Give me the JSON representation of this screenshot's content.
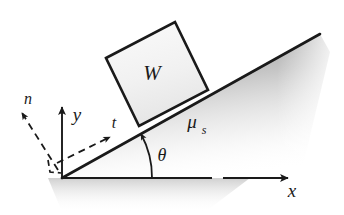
{
  "figure": {
    "background_color": "#ffffff",
    "ink_color": "#1a1a1a",
    "block_fill": "#f0f0f0",
    "shade_color": "#9a9a9a"
  },
  "labels": {
    "weight": "W",
    "friction_coefficient": "μ",
    "friction_subscript": "s",
    "angle": "θ",
    "axis_x": "x",
    "axis_y": "y",
    "vector_normal": "n",
    "vector_tangent": "t"
  },
  "geometry": {
    "origin": {
      "x": 62,
      "y": 178
    },
    "incline_tip": {
      "x": 320,
      "y": 34
    },
    "incline_angle_deg": 29,
    "x_axis_end": {
      "x": 288,
      "y": 178
    },
    "y_axis_end": {
      "x": 62,
      "y": 107
    },
    "block": {
      "top_left": {
        "x": 106,
        "y": 58
      },
      "top_right": {
        "x": 175,
        "y": 22
      },
      "bottom_right": {
        "x": 208,
        "y": 90
      },
      "bottom_left": {
        "x": 139,
        "y": 126
      }
    },
    "normal_vector": {
      "from": {
        "x": 58,
        "y": 170
      },
      "to": {
        "x": 21,
        "y": 112
      }
    },
    "tangent_vector": {
      "from": {
        "x": 61,
        "y": 161
      },
      "to": {
        "x": 110,
        "y": 137
      }
    },
    "theta_arc": {
      "start": {
        "x": 152,
        "y": 178
      },
      "end": {
        "x": 141,
        "y": 133
      }
    }
  },
  "label_positions": {
    "weight": {
      "x": 152,
      "y": 80
    },
    "mu": {
      "x": 192,
      "y": 128
    },
    "mu_sub": {
      "x": 205,
      "y": 133
    },
    "theta": {
      "x": 162,
      "y": 161
    },
    "axis_x": {
      "x": 292,
      "y": 196
    },
    "axis_y": {
      "x": 76,
      "y": 120
    },
    "vector_n": {
      "x": 28,
      "y": 104
    },
    "vector_t": {
      "x": 113,
      "y": 128
    }
  }
}
